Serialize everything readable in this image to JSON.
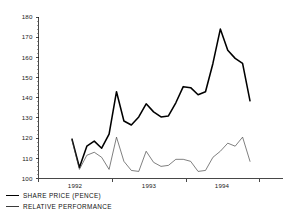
{
  "chart_data": {
    "type": "line",
    "title": "",
    "subtitle": "",
    "xlabel": "",
    "ylabel": "",
    "ylim": [
      100,
      180
    ],
    "y_ticks": [
      100,
      110,
      120,
      130,
      140,
      150,
      160,
      170,
      180
    ],
    "y_tick_labels": [
      "100",
      "110",
      "120",
      "130",
      "140",
      "150",
      "160",
      "170",
      "180"
    ],
    "y_minor_tick_step": 2,
    "x_tick_labels": [
      "1992",
      "1993",
      "1994"
    ],
    "x_axis_note": "Year labels positioned along a monthly time axis spanning early 1992 to early 1994",
    "grid": false,
    "legend_position": "below-left",
    "legend": [
      "SHARE PRICE (PENCE)",
      "RELATIVE PERFORMANCE"
    ],
    "x": [
      "1992-02",
      "1992-03",
      "1992-04",
      "1992-05",
      "1992-06",
      "1992-07",
      "1992-08",
      "1992-09",
      "1992-10",
      "1992-11",
      "1992-12",
      "1993-01",
      "1993-02",
      "1993-03",
      "1993-04",
      "1993-05",
      "1993-06",
      "1993-07",
      "1993-08",
      "1993-09",
      "1993-10",
      "1993-11",
      "1993-12",
      "1994-01",
      "1994-02"
    ],
    "series": [
      {
        "name": "SHARE PRICE (PENCE)",
        "style": "thick",
        "color": "#000000",
        "values": [
          119.5,
          105.5,
          116.0,
          118.5,
          115.0,
          122.0,
          143.0,
          128.5,
          126.5,
          130.5,
          137.0,
          133.0,
          130.5,
          131.0,
          137.5,
          145.5,
          145.0,
          141.5,
          143.0,
          157.0,
          174.0,
          163.5,
          159.5,
          157.0,
          138.5
        ]
      },
      {
        "name": "RELATIVE PERFORMANCE",
        "style": "thin",
        "color": "#3a3a3a",
        "values": [
          119.0,
          104.5,
          111.5,
          113.0,
          110.5,
          104.5,
          120.5,
          108.5,
          104.0,
          103.5,
          113.5,
          108.0,
          106.0,
          106.5,
          109.5,
          109.5,
          108.5,
          103.5,
          104.0,
          110.5,
          113.5,
          117.5,
          116.0,
          120.5,
          108.5
        ]
      }
    ]
  },
  "legend": {
    "items": [
      {
        "label": "SHARE PRICE (PENCE)",
        "style": "thick"
      },
      {
        "label": "RELATIVE PERFORMANCE",
        "style": "thin"
      }
    ]
  }
}
